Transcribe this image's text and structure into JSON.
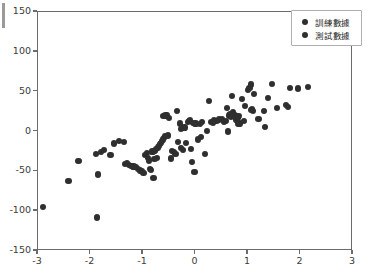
{
  "chart_data": {
    "type": "scatter",
    "title": "",
    "xlabel": "",
    "ylabel": "",
    "xlim": [
      -3,
      3
    ],
    "ylim": [
      -150,
      150
    ],
    "grid": false,
    "legend_position": "upper right",
    "xticks": [
      "-3",
      "-2",
      "-1",
      "0",
      "1",
      "2",
      "3"
    ],
    "xtick_values": [
      -3,
      -2,
      -1,
      0,
      1,
      2,
      3
    ],
    "yticks": [
      "150",
      "100",
      "50",
      "0",
      "-50",
      "-100",
      "-150"
    ],
    "ytick_values": [
      150,
      100,
      50,
      0,
      -50,
      -100,
      -150
    ],
    "marker_color": "#2f2f2f",
    "series": [
      {
        "name": "訓練數據",
        "color": "#2f2f2f",
        "marker": "o",
        "points": [
          [
            -2.9,
            -95
          ],
          [
            -2.42,
            -62
          ],
          [
            -2.23,
            -37
          ],
          [
            -1.9,
            -28
          ],
          [
            -1.88,
            -108
          ],
          [
            -1.86,
            -54
          ],
          [
            -1.75,
            -23
          ],
          [
            -1.62,
            -29
          ],
          [
            -1.55,
            -15
          ],
          [
            -1.36,
            -13
          ],
          [
            -1.34,
            -41
          ],
          [
            -1.3,
            -40
          ],
          [
            -1.26,
            -42
          ],
          [
            -1.22,
            -43
          ],
          [
            -1.18,
            -44
          ],
          [
            -1.14,
            -45
          ],
          [
            -1.1,
            -47
          ],
          [
            -1.06,
            -49
          ],
          [
            -1.02,
            -50
          ],
          [
            -0.99,
            -52
          ],
          [
            -0.96,
            -29
          ],
          [
            -0.93,
            -27
          ],
          [
            -0.9,
            -33
          ],
          [
            -0.88,
            -37
          ],
          [
            -0.86,
            -47
          ],
          [
            -0.84,
            -48
          ],
          [
            -0.82,
            -25
          ],
          [
            -0.8,
            -58
          ],
          [
            -0.78,
            -24
          ],
          [
            -0.76,
            -22
          ],
          [
            -0.74,
            -33
          ],
          [
            -0.72,
            -20
          ],
          [
            -0.7,
            -18
          ],
          [
            -0.68,
            -16
          ],
          [
            -0.66,
            -14
          ],
          [
            -0.64,
            -12
          ],
          [
            -0.62,
            -10
          ],
          [
            -0.6,
            -8
          ],
          [
            -0.58,
            -6
          ],
          [
            -0.57,
            20
          ],
          [
            -0.55,
            21
          ],
          [
            -0.53,
            -5
          ],
          [
            -0.5,
            17
          ],
          [
            -0.47,
            -34
          ],
          [
            -0.44,
            -24
          ],
          [
            -0.41,
            -26
          ],
          [
            -0.38,
            -28
          ],
          [
            -0.35,
            26
          ],
          [
            -0.33,
            -13
          ],
          [
            -0.3,
            10
          ],
          [
            -0.27,
            -21
          ],
          [
            -0.24,
            -23
          ],
          [
            -0.21,
            5
          ],
          [
            -0.18,
            -14
          ],
          [
            -0.15,
            12
          ],
          [
            -0.12,
            13
          ],
          [
            -0.1,
            14
          ],
          [
            -0.08,
            -22
          ],
          [
            -0.06,
            -38
          ],
          [
            -0.04,
            11
          ],
          [
            -0.02,
            -51
          ],
          [
            0.0,
            10
          ],
          [
            0.04,
            -10
          ],
          [
            0.08,
            9
          ],
          [
            0.12,
            12
          ],
          [
            0.18,
            -28
          ],
          [
            0.22,
            1
          ],
          [
            0.25,
            38
          ],
          [
            0.3,
            12
          ],
          [
            0.35,
            14
          ],
          [
            0.4,
            13
          ],
          [
            0.45,
            15
          ],
          [
            0.5,
            16
          ],
          [
            0.55,
            12
          ],
          [
            0.6,
            30
          ],
          [
            0.62,
            0
          ],
          [
            0.64,
            20
          ],
          [
            0.66,
            22
          ],
          [
            0.68,
            18
          ],
          [
            0.7,
            45
          ],
          [
            0.72,
            24
          ],
          [
            0.75,
            21
          ],
          [
            0.78,
            15
          ],
          [
            0.8,
            17
          ],
          [
            0.82,
            19
          ],
          [
            0.85,
            10
          ],
          [
            0.88,
            41
          ],
          [
            0.92,
            13
          ],
          [
            0.95,
            32
          ],
          [
            1.0,
            52
          ],
          [
            1.03,
            55
          ],
          [
            1.05,
            59
          ],
          [
            1.08,
            28
          ],
          [
            1.1,
            26
          ],
          [
            1.12,
            47
          ],
          [
            1.2,
            16
          ],
          [
            1.3,
            26
          ],
          [
            1.32,
            6
          ],
          [
            1.38,
            42
          ],
          [
            1.45,
            60
          ],
          [
            1.55,
            30
          ],
          [
            1.72,
            33
          ],
          [
            1.76,
            31
          ],
          [
            1.8,
            55
          ],
          [
            1.95,
            54
          ],
          [
            2.15,
            56
          ]
        ]
      },
      {
        "name": "測試數據",
        "color": "#2f2f2f",
        "marker": "o",
        "points": [
          [
            -1.8,
            -26
          ],
          [
            -1.45,
            -12
          ],
          [
            -0.78,
            -35
          ],
          [
            -0.62,
            19
          ],
          [
            -0.28,
            3
          ],
          [
            0.1,
            -7
          ],
          [
            0.33,
            11
          ],
          [
            0.58,
            13
          ],
          [
            0.82,
            9
          ],
          [
            1.06,
            27
          ]
        ]
      }
    ]
  },
  "legend": {
    "entries": [
      {
        "label": "訓練數據"
      },
      {
        "label": "測試數據"
      }
    ]
  }
}
